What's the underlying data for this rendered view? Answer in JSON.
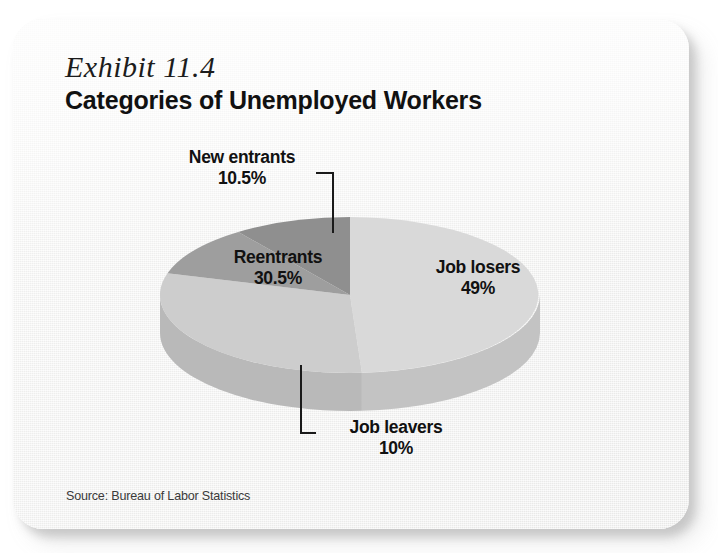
{
  "card": {
    "exhibit_number": "Exhibit 11.4",
    "title": "Categories of Unemployed Workers",
    "source": "Source: Bureau of Labor Statistics"
  },
  "colors": {
    "card_background": "#f4f4f3",
    "text": "#111111",
    "job_losers": "#d9d9d9",
    "job_losers_side": "#cccccc",
    "reentrants": "#cdcdcd",
    "reentrants_side": "#c2c2c2",
    "new_entrants": "#9e9e9e",
    "job_leavers": "#8f8f8f",
    "job_leavers_side": "#767676",
    "leader_line": "#1a1a1a"
  },
  "labels": {
    "new_entrants": {
      "name": "New entrants",
      "percent": "10.5%"
    },
    "reentrants": {
      "name": "Reentrants",
      "percent": "30.5%"
    },
    "job_losers": {
      "name": "Job losers",
      "percent": "49%"
    },
    "job_leavers": {
      "name": "Job leavers",
      "percent": "10%"
    }
  },
  "chart_data": {
    "type": "pie",
    "title": "Categories of Unemployed Workers",
    "subtitle": "Exhibit 11.4",
    "source": "Source: Bureau of Labor Statistics",
    "three_d": true,
    "legend_position": "none",
    "labels_inline": true,
    "unit": "percent",
    "categories": [
      "Job losers",
      "Reentrants",
      "New entrants",
      "Job leavers"
    ],
    "values": [
      49,
      30.5,
      10.5,
      10
    ],
    "value_labels": [
      "49%",
      "30.5%",
      "10.5%",
      "10%"
    ],
    "slice_colors": [
      "#d9d9d9",
      "#cdcdcd",
      "#9e9e9e",
      "#8f8f8f"
    ],
    "slices": [
      {
        "label": "Job losers",
        "value": 49,
        "display": "49%",
        "color": "#d9d9d9",
        "label_placement": "inside"
      },
      {
        "label": "Reentrants",
        "value": 30.5,
        "display": "30.5%",
        "color": "#cdcdcd",
        "label_placement": "inside"
      },
      {
        "label": "New entrants",
        "value": 10.5,
        "display": "10.5%",
        "color": "#9e9e9e",
        "label_placement": "outside-leader"
      },
      {
        "label": "Job leavers",
        "value": 10,
        "display": "10%",
        "color": "#8f8f8f",
        "label_placement": "outside-leader"
      }
    ],
    "total": 100
  }
}
